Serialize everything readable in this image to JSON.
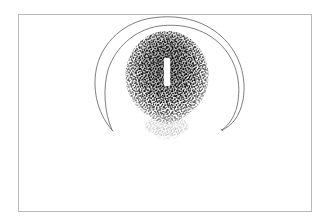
{
  "figure": {
    "kind": "scientific-line-and-stipple-illustration",
    "background_color": "#ffffff",
    "frame": {
      "present": true,
      "stroke_color": "#b9b9b9",
      "stroke_width": 1,
      "x": 18,
      "y": 14,
      "width": 294,
      "height": 198
    },
    "ink_color": "#1a1a1a",
    "line_color": "#6e6e6e",
    "elements": [
      {
        "name": "stippled-body",
        "description": "dense black stipple mass, rounded triangular / ovoid outline, darkest at upper centre, fading at the lower margin into a faint trailing shadow",
        "center_x": 167,
        "center_y": 78,
        "radius_x": 40,
        "radius_y": 47,
        "dot_count": 4200,
        "color": "#111111"
      },
      {
        "name": "central-slit",
        "description": "white vertical bar (unstippled slit) at the centre of the stippled body",
        "x": 164,
        "y": 58,
        "width": 6,
        "height": 28,
        "color": "#ffffff"
      },
      {
        "name": "outer-crescent-arc",
        "description": "thin open horseshoe outline enclosing the stippled body, open at the bottom, tips tapering to points",
        "color": "#6e6e6e",
        "stroke_width": 1
      },
      {
        "name": "inner-crescent-arc",
        "description": "second concentric arc just inside the outer arc, meeting it at both pointed tips",
        "color": "#6e6e6e",
        "stroke_width": 1
      }
    ],
    "labels": [],
    "caption": ""
  }
}
